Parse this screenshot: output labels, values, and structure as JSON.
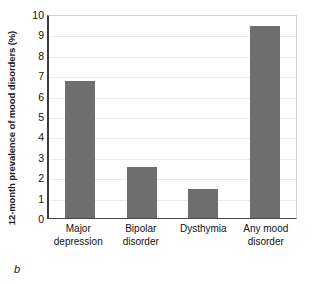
{
  "chart_data": {
    "type": "bar",
    "title": "",
    "subtitle": "",
    "xlabel": "",
    "ylabel": "12-month prevalence of mood disorders (%)",
    "categories": [
      "Major depression",
      "Bipolar disorder",
      "Dysthymia",
      "Any mood disorder"
    ],
    "category_lines": [
      [
        "Major",
        "depression"
      ],
      [
        "Bipolar",
        "disorder"
      ],
      [
        "Dysthymia"
      ],
      [
        "Any mood",
        "disorder"
      ]
    ],
    "values": [
      6.7,
      2.5,
      1.4,
      9.4
    ],
    "ylim": [
      0,
      10
    ],
    "yticks": [
      0,
      1,
      2,
      3,
      4,
      5,
      6,
      7,
      8,
      9,
      10
    ],
    "ytick_labels": [
      "0",
      "1",
      "2",
      "3",
      "4",
      "5",
      "6",
      "7",
      "8",
      "9",
      "10"
    ],
    "grid": true,
    "grid_axis": "y",
    "legend": false,
    "legend_position": "none",
    "bar_color": "#6e6e6e",
    "grid_color": "#e9e9e9",
    "axis_color": "#3a3a3a"
  },
  "figure": {
    "panel_label": "b"
  }
}
